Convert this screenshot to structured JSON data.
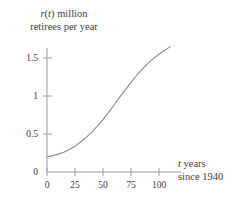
{
  "chart_data": {
    "type": "line",
    "title": "",
    "subtitle": "",
    "ylabel_line1": "r(t) million",
    "ylabel_line2": "retirees per year",
    "ylabel_var": "r",
    "ylabel_var2": "t",
    "xlabel_line1": "t years",
    "xlabel_line2": "since 1940",
    "xlabel_var": "t",
    "xlabel": "t years since 1940",
    "ylabel": "r(t) million retirees per year",
    "grid": false,
    "legend": false,
    "legend_position": "none",
    "line_color": "#8a8a8a",
    "axis_color": "#9a9a9a",
    "text_color": "#3d3d3d",
    "xlim": [
      0,
      110
    ],
    "ylim": [
      0,
      1.78
    ],
    "xticks": [
      0,
      25,
      50,
      75,
      100
    ],
    "xtick_labels": [
      "0",
      "25",
      "50",
      "75",
      "100"
    ],
    "yticks": [
      0,
      0.5,
      1,
      1.5
    ],
    "ytick_labels": [
      "0",
      "0.5",
      "1",
      "1.5"
    ],
    "x": [
      0,
      5,
      10,
      15,
      20,
      25,
      30,
      35,
      40,
      45,
      50,
      55,
      60,
      65,
      70,
      75,
      80,
      85,
      90,
      95,
      100,
      105,
      110
    ],
    "y": [
      0.2,
      0.215,
      0.235,
      0.26,
      0.295,
      0.34,
      0.395,
      0.455,
      0.525,
      0.605,
      0.69,
      0.785,
      0.885,
      0.985,
      1.085,
      1.18,
      1.27,
      1.35,
      1.43,
      1.495,
      1.55,
      1.6,
      1.65
    ],
    "series": [
      {
        "name": "r(t)",
        "values": [
          0.2,
          0.215,
          0.235,
          0.26,
          0.295,
          0.34,
          0.395,
          0.455,
          0.525,
          0.605,
          0.69,
          0.785,
          0.885,
          0.985,
          1.085,
          1.18,
          1.27,
          1.35,
          1.43,
          1.495,
          1.55,
          1.6,
          1.65
        ]
      }
    ]
  }
}
